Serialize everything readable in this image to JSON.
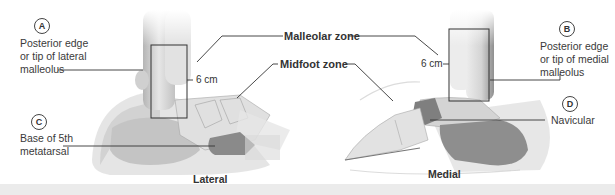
{
  "figure": {
    "zones": {
      "malleolar": "Malleolar zone",
      "midfoot": "Midfoot zone"
    },
    "views": {
      "lateral": "Lateral",
      "medial": "Medial"
    },
    "measurement": "6 cm",
    "markers": [
      {
        "letter": "A",
        "text_lines": [
          "Posterior edge",
          "or tip of lateral",
          "malleolus"
        ]
      },
      {
        "letter": "B",
        "text_lines": [
          "Posterior edge",
          "or tip of medial",
          "malleolus"
        ]
      },
      {
        "letter": "C",
        "text_lines": [
          "Base of 5th",
          "metatarsal"
        ]
      },
      {
        "letter": "D",
        "text_lines": [
          "Navicular"
        ]
      }
    ],
    "colors": {
      "bone": "#d9d9d9",
      "bone_dark": "#8c8c8c",
      "zone_shade": "#c8c8c8",
      "line": "#333333"
    }
  }
}
